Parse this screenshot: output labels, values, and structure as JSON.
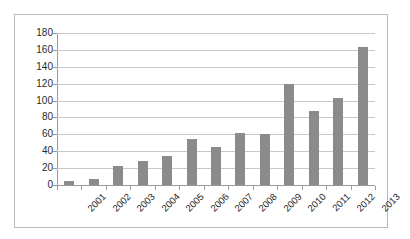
{
  "chart_data": {
    "type": "bar",
    "title": "",
    "xlabel": "",
    "ylabel": "",
    "ylim": [
      0,
      180
    ],
    "ytick_step": 20,
    "grid": true,
    "legend": "none",
    "bar_color": "#8b8b8b",
    "categories": [
      "2001",
      "2002",
      "2003",
      "2004",
      "2005",
      "2006",
      "2007",
      "2008",
      "2009",
      "2010",
      "2011",
      "2012",
      "2013"
    ],
    "values": [
      5,
      7,
      22,
      29,
      34,
      55,
      45,
      62,
      60,
      120,
      88,
      103,
      164
    ],
    "ytick_labels": [
      "180",
      "160",
      "140",
      "120",
      "100",
      "80",
      "60",
      "40",
      "20",
      "0"
    ],
    "series": [
      {
        "name": "",
        "values": [
          5,
          7,
          22,
          29,
          34,
          55,
          45,
          62,
          60,
          120,
          88,
          103,
          164
        ]
      }
    ]
  }
}
